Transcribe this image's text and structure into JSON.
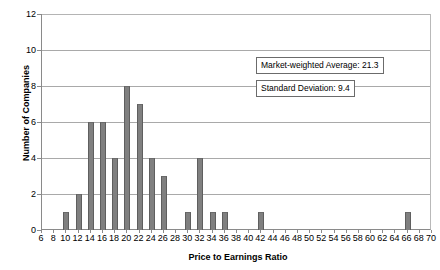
{
  "chart_data": {
    "type": "bar",
    "title": "",
    "subtitle": "",
    "xlabel": "Price to Earnings Ratio",
    "ylabel": "Number of Companies",
    "xlim": [
      6,
      70
    ],
    "ylim": [
      0,
      12
    ],
    "ytick_step": 2,
    "xtick_step": 2,
    "grid": true,
    "legend": "none",
    "xticks": [
      6,
      8,
      10,
      12,
      14,
      16,
      18,
      20,
      22,
      24,
      26,
      28,
      30,
      32,
      34,
      36,
      38,
      40,
      42,
      44,
      46,
      48,
      50,
      52,
      54,
      56,
      58,
      60,
      62,
      64,
      66,
      68,
      70
    ],
    "yticks": [
      0,
      2,
      4,
      6,
      8,
      10,
      12
    ],
    "bar_color": "#808080",
    "categories": [
      6,
      8,
      10,
      12,
      14,
      16,
      18,
      20,
      22,
      24,
      26,
      28,
      30,
      32,
      34,
      36,
      38,
      40,
      42,
      44,
      46,
      48,
      50,
      52,
      54,
      56,
      58,
      60,
      62,
      64,
      66,
      68,
      70
    ],
    "values": [
      0,
      0,
      1,
      2,
      6,
      6,
      4,
      8,
      7,
      4,
      3,
      0,
      1,
      4,
      1,
      1,
      0,
      0,
      1,
      0,
      0,
      0,
      0,
      0,
      0,
      0,
      0,
      0,
      0,
      0,
      1,
      0,
      0
    ],
    "annotations": [
      {
        "text": "Market-weighted Average: 21.3",
        "value": 21.3
      },
      {
        "text": "Standard Deviation: 9.4",
        "value": 9.4
      }
    ]
  }
}
